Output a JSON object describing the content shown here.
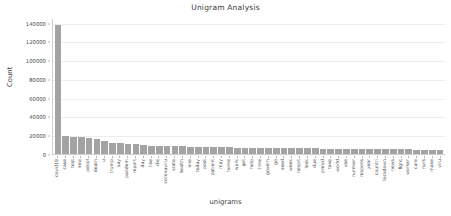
{
  "chart_data": {
    "type": "bar",
    "title": "Unigram Analysis",
    "xlabel": "unigrams",
    "ylabel": "Count",
    "ylim": [
      0,
      145000
    ],
    "grid": true,
    "legend": null,
    "yticks": [
      0,
      20000,
      40000,
      60000,
      80000,
      100000,
      120000,
      140000
    ],
    "ytick_labels": [
      "0",
      "20000",
      "40000",
      "60000",
      "80000",
      "100000",
      "120000",
      "140000"
    ],
    "bar_color": "#a3a3a3",
    "categories": [
      "covid19",
      "case",
      "test",
      "new",
      "peopl",
      "death",
      "u",
      "trump",
      "say",
      "pandem",
      "report",
      "day",
      "like",
      "die",
      "coronaviru",
      "state",
      "health",
      "one",
      "today",
      "post",
      "patient",
      "may",
      "home",
      "work",
      "get",
      "help",
      "time",
      "govern",
      "go",
      "need",
      "week",
      "hospit",
      "look",
      "due",
      "presid",
      "take",
      "world",
      "use",
      "number",
      "respons",
      "year",
      "countri",
      "lockdown",
      "news",
      "fight",
      "worker",
      "care",
      "nurs",
      "make",
      "viru"
    ],
    "values": [
      138000,
      18700,
      18300,
      18000,
      17000,
      16200,
      14100,
      11900,
      11500,
      10600,
      10200,
      9600,
      9000,
      8700,
      8500,
      8300,
      8100,
      7900,
      7700,
      7500,
      7300,
      7100,
      7000,
      6900,
      6800,
      6700,
      6600,
      6500,
      6400,
      6300,
      6200,
      6100,
      6000,
      5900,
      5800,
      5700,
      5600,
      5500,
      5400,
      5300,
      5200,
      5100,
      5000,
      4950,
      4900,
      4850,
      4800,
      4750,
      4700,
      4650
    ]
  }
}
